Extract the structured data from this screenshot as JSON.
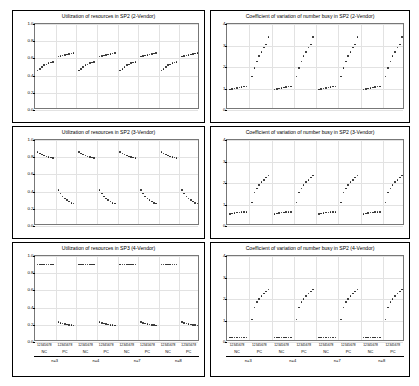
{
  "figure": {
    "background": "#ffffff",
    "point_color": "#1b1b1b",
    "grid_color": "#e2e2e2"
  },
  "panels": [
    {
      "id": "util-2v",
      "title": "Utilization of resources in SP2 (2-Vendor)",
      "yticks": [
        "1.0",
        "0.8",
        "0.6",
        "0.4",
        "0.2",
        "0.0"
      ],
      "ylim": [
        0.0,
        1.0
      ]
    },
    {
      "id": "cv-2v",
      "title": "Coefficient of variation of number busy in SP2 (2-Vendor)",
      "yticks": [
        "4",
        "3",
        "2",
        "1",
        "0"
      ],
      "ylim": [
        0,
        4
      ]
    },
    {
      "id": "util-3v",
      "title": "Utilization of resources in SP2 (3-Vendor)",
      "yticks": [
        "1.0",
        "0.8",
        "0.6",
        "0.4",
        "0.2",
        "0.0"
      ],
      "ylim": [
        0.0,
        1.0
      ]
    },
    {
      "id": "cv-3v",
      "title": "Coefficient of variation of number busy in SP2 (3-Vendor)",
      "yticks": [
        "4",
        "3",
        "2",
        "1",
        "0"
      ],
      "ylim": [
        0,
        4
      ]
    },
    {
      "id": "util-4v",
      "title": "Utilization of resources in SP3 (4-Vendor)",
      "yticks": [
        "1.0",
        "0.8",
        "0.6",
        "0.4",
        "0.2",
        "0.0"
      ],
      "ylim": [
        0.0,
        1.0
      ]
    },
    {
      "id": "cv-4v",
      "title": "Coefficient of variation of number busy in SP2 (4-Vendor)",
      "yticks": [
        "4",
        "3",
        "2",
        "1",
        "0"
      ],
      "ylim": [
        0,
        4
      ]
    }
  ],
  "xaxis": {
    "index_labels": [
      "12345678",
      "12345678",
      "12345678",
      "12345678",
      "12345678",
      "12345678",
      "12345678",
      "12345678"
    ],
    "group_labels": [
      "NC",
      "PC",
      "NC",
      "PC",
      "NC",
      "PC",
      "NC",
      "PC"
    ],
    "super_labels": [
      "n=3",
      "n=4",
      "n=7",
      "n=8"
    ]
  },
  "chart_data": {
    "type": "scatter",
    "xlabel": "",
    "ylabel": "",
    "grid": true,
    "legend": "none",
    "x_categories": [
      "n=3 NC",
      "n=3 PC",
      "n=4 NC",
      "n=4 PC",
      "n=7 NC",
      "n=7 PC",
      "n=8 NC",
      "n=8 PC"
    ],
    "x_subindices": [
      1,
      2,
      3,
      4,
      5,
      6,
      7,
      8
    ],
    "panels": [
      {
        "name": "Utilization of resources in SP2 (2-Vendor)",
        "ylim": [
          0.0,
          1.0
        ],
        "groups": [
          {
            "label": "n=3 NC",
            "values": [
              0.46,
              0.48,
              0.5,
              0.52,
              0.53,
              0.545,
              0.55,
              0.56
            ]
          },
          {
            "label": "n=3 PC",
            "values": [
              0.62,
              0.63,
              0.635,
              0.64,
              0.645,
              0.65,
              0.655,
              0.66
            ]
          },
          {
            "label": "n=4 NC",
            "values": [
              0.46,
              0.48,
              0.5,
              0.52,
              0.53,
              0.545,
              0.55,
              0.56
            ]
          },
          {
            "label": "n=4 PC",
            "values": [
              0.62,
              0.63,
              0.635,
              0.64,
              0.645,
              0.65,
              0.655,
              0.66
            ]
          },
          {
            "label": "n=7 NC",
            "values": [
              0.46,
              0.48,
              0.5,
              0.52,
              0.53,
              0.545,
              0.55,
              0.56
            ]
          },
          {
            "label": "n=7 PC",
            "values": [
              0.62,
              0.63,
              0.635,
              0.64,
              0.645,
              0.65,
              0.655,
              0.66
            ]
          },
          {
            "label": "n=8 NC",
            "values": [
              0.46,
              0.48,
              0.5,
              0.52,
              0.53,
              0.545,
              0.55,
              0.56
            ]
          },
          {
            "label": "n=8 PC",
            "values": [
              0.62,
              0.63,
              0.635,
              0.64,
              0.645,
              0.65,
              0.655,
              0.66
            ]
          }
        ]
      },
      {
        "name": "Coefficient of variation of number busy in SP2 (2-Vendor)",
        "ylim": [
          0,
          4
        ],
        "groups": [
          {
            "label": "n=3 NC",
            "values": [
              0.95,
              0.98,
              1.0,
              1.02,
              1.05,
              1.07,
              1.09,
              1.1
            ]
          },
          {
            "label": "n=3 PC",
            "values": [
              1.55,
              1.95,
              2.25,
              2.5,
              2.7,
              2.9,
              3.05,
              3.4
            ]
          },
          {
            "label": "n=4 NC",
            "values": [
              0.95,
              0.98,
              1.0,
              1.02,
              1.05,
              1.07,
              1.09,
              1.1
            ]
          },
          {
            "label": "n=4 PC",
            "values": [
              1.55,
              1.95,
              2.25,
              2.5,
              2.7,
              2.9,
              3.05,
              3.4
            ]
          },
          {
            "label": "n=7 NC",
            "values": [
              0.95,
              0.98,
              1.0,
              1.02,
              1.05,
              1.07,
              1.09,
              1.1
            ]
          },
          {
            "label": "n=7 PC",
            "values": [
              1.55,
              1.95,
              2.25,
              2.5,
              2.7,
              2.9,
              3.05,
              3.4
            ]
          },
          {
            "label": "n=8 NC",
            "values": [
              0.95,
              0.98,
              1.0,
              1.02,
              1.05,
              1.07,
              1.09,
              1.1
            ]
          },
          {
            "label": "n=8 PC",
            "values": [
              1.55,
              1.95,
              2.25,
              2.5,
              2.7,
              2.9,
              3.05,
              3.4
            ]
          }
        ]
      },
      {
        "name": "Utilization of resources in SP2 (3-Vendor)",
        "ylim": [
          0.0,
          1.0
        ],
        "groups": [
          {
            "label": "n=3 NC",
            "values": [
              0.86,
              0.845,
              0.83,
              0.82,
              0.81,
              0.8,
              0.795,
              0.79
            ]
          },
          {
            "label": "n=3 PC",
            "values": [
              0.42,
              0.38,
              0.345,
              0.32,
              0.3,
              0.285,
              0.27,
              0.26
            ]
          },
          {
            "label": "n=4 NC",
            "values": [
              0.86,
              0.845,
              0.83,
              0.82,
              0.81,
              0.8,
              0.795,
              0.79
            ]
          },
          {
            "label": "n=4 PC",
            "values": [
              0.42,
              0.38,
              0.345,
              0.32,
              0.3,
              0.285,
              0.27,
              0.26
            ]
          },
          {
            "label": "n=7 NC",
            "values": [
              0.86,
              0.845,
              0.83,
              0.82,
              0.81,
              0.8,
              0.795,
              0.79
            ]
          },
          {
            "label": "n=7 PC",
            "values": [
              0.42,
              0.38,
              0.345,
              0.32,
              0.3,
              0.285,
              0.27,
              0.26
            ]
          },
          {
            "label": "n=8 NC",
            "values": [
              0.86,
              0.845,
              0.83,
              0.82,
              0.81,
              0.8,
              0.795,
              0.79
            ]
          },
          {
            "label": "n=8 PC",
            "values": [
              0.42,
              0.38,
              0.345,
              0.32,
              0.3,
              0.285,
              0.27,
              0.26
            ]
          }
        ]
      },
      {
        "name": "Coefficient of variation of number busy in SP2 (3-Vendor)",
        "ylim": [
          0,
          4
        ],
        "groups": [
          {
            "label": "n=3 NC",
            "values": [
              0.55,
              0.58,
              0.6,
              0.62,
              0.63,
              0.64,
              0.65,
              0.66
            ]
          },
          {
            "label": "n=3 PC",
            "values": [
              1.1,
              1.55,
              1.75,
              1.9,
              2.05,
              2.15,
              2.25,
              2.35
            ]
          },
          {
            "label": "n=4 NC",
            "values": [
              0.55,
              0.58,
              0.6,
              0.62,
              0.63,
              0.64,
              0.65,
              0.66
            ]
          },
          {
            "label": "n=4 PC",
            "values": [
              1.1,
              1.55,
              1.75,
              1.9,
              2.05,
              2.15,
              2.25,
              2.35
            ]
          },
          {
            "label": "n=7 NC",
            "values": [
              0.55,
              0.58,
              0.6,
              0.62,
              0.63,
              0.64,
              0.65,
              0.66
            ]
          },
          {
            "label": "n=7 PC",
            "values": [
              1.1,
              1.55,
              1.75,
              1.9,
              2.05,
              2.15,
              2.25,
              2.35
            ]
          },
          {
            "label": "n=8 NC",
            "values": [
              0.55,
              0.58,
              0.6,
              0.62,
              0.63,
              0.64,
              0.65,
              0.66
            ]
          },
          {
            "label": "n=8 PC",
            "values": [
              1.1,
              1.55,
              1.75,
              1.9,
              2.05,
              2.15,
              2.25,
              2.35
            ]
          }
        ]
      },
      {
        "name": "Utilization of resources in SP3 (4-Vendor)",
        "ylim": [
          0.0,
          1.0
        ],
        "groups": [
          {
            "label": "n=3 NC",
            "values": [
              0.9,
              0.9,
              0.9,
              0.9,
              0.9,
              0.9,
              0.9,
              0.9
            ]
          },
          {
            "label": "n=3 PC",
            "values": [
              0.23,
              0.22,
              0.215,
              0.21,
              0.205,
              0.2,
              0.195,
              0.19
            ]
          },
          {
            "label": "n=4 NC",
            "values": [
              0.9,
              0.9,
              0.9,
              0.9,
              0.9,
              0.9,
              0.9,
              0.9
            ]
          },
          {
            "label": "n=4 PC",
            "values": [
              0.23,
              0.22,
              0.215,
              0.21,
              0.205,
              0.2,
              0.195,
              0.19
            ]
          },
          {
            "label": "n=7 NC",
            "values": [
              0.9,
              0.9,
              0.9,
              0.9,
              0.9,
              0.9,
              0.9,
              0.9
            ]
          },
          {
            "label": "n=7 PC",
            "values": [
              0.23,
              0.22,
              0.215,
              0.21,
              0.205,
              0.2,
              0.195,
              0.19
            ]
          },
          {
            "label": "n=8 NC",
            "values": [
              0.9,
              0.9,
              0.9,
              0.9,
              0.9,
              0.9,
              0.9,
              0.9
            ]
          },
          {
            "label": "n=8 PC",
            "values": [
              0.23,
              0.22,
              0.215,
              0.21,
              0.205,
              0.2,
              0.195,
              0.19
            ]
          }
        ]
      },
      {
        "name": "Coefficient of variation of number busy in SP2 (4-Vendor)",
        "ylim": [
          0,
          4
        ],
        "groups": [
          {
            "label": "n=3 NC",
            "values": [
              0.2,
              0.2,
              0.2,
              0.2,
              0.2,
              0.2,
              0.2,
              0.2
            ]
          },
          {
            "label": "n=3 PC",
            "values": [
              1.05,
              1.6,
              1.85,
              2.0,
              2.15,
              2.25,
              2.35,
              2.45
            ]
          },
          {
            "label": "n=4 NC",
            "values": [
              0.2,
              0.2,
              0.2,
              0.2,
              0.2,
              0.2,
              0.2,
              0.2
            ]
          },
          {
            "label": "n=4 PC",
            "values": [
              1.05,
              1.6,
              1.85,
              2.0,
              2.15,
              2.25,
              2.35,
              2.45
            ]
          },
          {
            "label": "n=7 NC",
            "values": [
              0.2,
              0.2,
              0.2,
              0.2,
              0.2,
              0.2,
              0.2,
              0.2
            ]
          },
          {
            "label": "n=7 PC",
            "values": [
              1.05,
              1.6,
              1.85,
              2.0,
              2.15,
              2.25,
              2.35,
              2.45
            ]
          },
          {
            "label": "n=8 NC",
            "values": [
              0.2,
              0.2,
              0.2,
              0.2,
              0.2,
              0.2,
              0.2,
              0.2
            ]
          },
          {
            "label": "n=8 PC",
            "values": [
              1.05,
              1.6,
              1.85,
              2.0,
              2.15,
              2.25,
              2.35,
              2.45
            ]
          }
        ]
      }
    ]
  }
}
